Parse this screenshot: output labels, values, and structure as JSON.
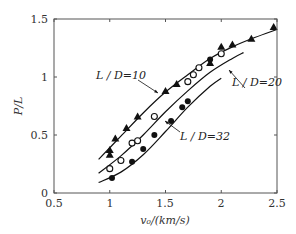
{
  "chart_data": {
    "type": "scatter",
    "title": "",
    "xlabel": "v0/(km/s)",
    "ylabel": "P/L",
    "xlim": [
      0.5,
      2.5
    ],
    "ylim": [
      0,
      1.5
    ],
    "xticks": [
      "0.5",
      "1",
      "1.5",
      "2",
      "2.5"
    ],
    "yticks": [
      "0",
      "0.5",
      "1",
      "1.5"
    ],
    "grid": false,
    "legend": "none (inline annotations)",
    "series": [
      {
        "name": "L/D=10",
        "marker": "filled-triangle",
        "points": [
          [
            1.0,
            0.37
          ],
          [
            1.0,
            0.33
          ],
          [
            1.05,
            0.47
          ],
          [
            1.15,
            0.56
          ],
          [
            1.25,
            0.66
          ],
          [
            1.5,
            0.88
          ],
          [
            1.6,
            0.94
          ],
          [
            1.9,
            1.12
          ],
          [
            2.0,
            1.26
          ],
          [
            2.1,
            1.28
          ],
          [
            2.27,
            1.33
          ],
          [
            2.47,
            1.43
          ]
        ],
        "fit": [
          [
            0.9,
            0.29
          ],
          [
            1.1,
            0.49
          ],
          [
            1.3,
            0.69
          ],
          [
            1.5,
            0.87
          ],
          [
            1.7,
            1.02
          ],
          [
            1.9,
            1.16
          ],
          [
            2.1,
            1.26
          ],
          [
            2.3,
            1.34
          ],
          [
            2.5,
            1.41
          ]
        ]
      },
      {
        "name": "L/D=20",
        "marker": "open-circle",
        "points": [
          [
            1.0,
            0.21
          ],
          [
            1.1,
            0.28
          ],
          [
            1.2,
            0.43
          ],
          [
            1.25,
            0.45
          ],
          [
            1.4,
            0.66
          ],
          [
            1.7,
            0.96
          ],
          [
            1.75,
            1.02
          ],
          [
            1.8,
            1.08
          ],
          [
            2.0,
            1.2
          ]
        ],
        "fit": [
          [
            0.9,
            0.17
          ],
          [
            1.1,
            0.32
          ],
          [
            1.3,
            0.5
          ],
          [
            1.5,
            0.7
          ],
          [
            1.7,
            0.88
          ],
          [
            1.9,
            1.04
          ],
          [
            2.1,
            1.16
          ],
          [
            2.2,
            1.21
          ]
        ]
      },
      {
        "name": "L/D=32",
        "marker": "filled-circle",
        "points": [
          [
            1.02,
            0.13
          ],
          [
            1.2,
            0.27
          ],
          [
            1.3,
            0.38
          ],
          [
            1.4,
            0.5
          ],
          [
            1.55,
            0.62
          ],
          [
            1.65,
            0.74
          ],
          [
            1.7,
            0.79
          ],
          [
            1.9,
            1.15
          ]
        ],
        "fit": [
          [
            0.9,
            0.09
          ],
          [
            1.1,
            0.18
          ],
          [
            1.3,
            0.33
          ],
          [
            1.5,
            0.53
          ],
          [
            1.7,
            0.74
          ],
          [
            1.9,
            0.92
          ],
          [
            2.0,
            0.99
          ]
        ]
      }
    ],
    "annotations": [
      {
        "text": "L/D=10",
        "x": 0.78,
        "y": 1.01,
        "arrow_to": [
          1.1,
          0.85
        ]
      },
      {
        "text": "L/D=20",
        "x": 2.1,
        "y": 0.93,
        "arrow_to": [
          2.0,
          1.15
        ]
      },
      {
        "text": "L/D=32",
        "x": 1.7,
        "y": 0.47,
        "arrow_to": [
          1.55,
          0.6
        ]
      }
    ]
  },
  "labels": {
    "x_axis": "v₀/(km/s)",
    "y_axis": "P/L",
    "ann10": "L / D=10",
    "ann20": "L / D=20",
    "ann32": "L / D=32",
    "xt0": "0.5",
    "xt1": "1",
    "xt2": "1.5",
    "xt3": "2",
    "xt4": "2.5",
    "yt0": "0",
    "yt1": "0.5",
    "yt2": "1",
    "yt3": "1.5"
  }
}
